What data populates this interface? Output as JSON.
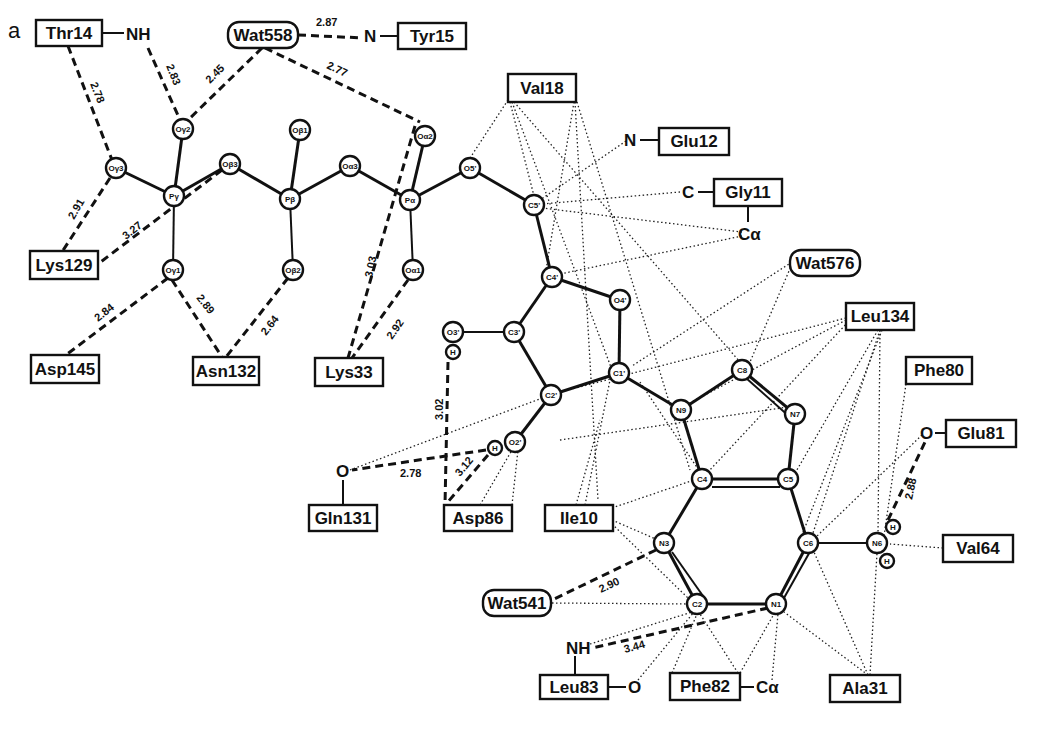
{
  "figure": {
    "panel_label": "a"
  },
  "residues": [
    {
      "id": "Thr14",
      "label": "Thr14",
      "x": 36,
      "y": 20,
      "w": 66,
      "h": 26,
      "shape": "box"
    },
    {
      "id": "Wat558",
      "label": "Wat558",
      "x": 228,
      "y": 22,
      "w": 70,
      "h": 26,
      "shape": "round"
    },
    {
      "id": "Tyr15",
      "label": "Tyr15",
      "x": 398,
      "y": 23,
      "w": 68,
      "h": 26,
      "shape": "box"
    },
    {
      "id": "Val18",
      "label": "Val18",
      "x": 508,
      "y": 74,
      "w": 68,
      "h": 28,
      "shape": "box"
    },
    {
      "id": "Glu12",
      "label": "Glu12",
      "x": 659,
      "y": 128,
      "w": 70,
      "h": 27,
      "shape": "box"
    },
    {
      "id": "Gly11",
      "label": "Gly11",
      "x": 714,
      "y": 179,
      "w": 68,
      "h": 27,
      "shape": "box"
    },
    {
      "id": "Wat576",
      "label": "Wat576",
      "x": 790,
      "y": 250,
      "w": 70,
      "h": 26,
      "shape": "round"
    },
    {
      "id": "Lys129",
      "label": "Lys129",
      "x": 30,
      "y": 251,
      "w": 68,
      "h": 28,
      "shape": "box"
    },
    {
      "id": "Leu134",
      "label": "Leu134",
      "x": 846,
      "y": 303,
      "w": 68,
      "h": 27,
      "shape": "box"
    },
    {
      "id": "Phe80",
      "label": "Phe80",
      "x": 906,
      "y": 357,
      "w": 66,
      "h": 27,
      "shape": "box"
    },
    {
      "id": "Asp145",
      "label": "Asp145",
      "x": 31,
      "y": 355,
      "w": 68,
      "h": 28,
      "shape": "box"
    },
    {
      "id": "Asn132",
      "label": "Asn132",
      "x": 193,
      "y": 357,
      "w": 66,
      "h": 28,
      "shape": "box"
    },
    {
      "id": "Lys33",
      "label": "Lys33",
      "x": 315,
      "y": 358,
      "w": 68,
      "h": 28,
      "shape": "box"
    },
    {
      "id": "Glu81",
      "label": "Glu81",
      "x": 946,
      "y": 420,
      "w": 70,
      "h": 27,
      "shape": "box"
    },
    {
      "id": "Gln131",
      "label": "Gln131",
      "x": 309,
      "y": 505,
      "w": 68,
      "h": 26,
      "shape": "box"
    },
    {
      "id": "Asp86",
      "label": "Asp86",
      "x": 444,
      "y": 505,
      "w": 68,
      "h": 26,
      "shape": "box"
    },
    {
      "id": "Ile10",
      "label": "Ile10",
      "x": 545,
      "y": 505,
      "w": 68,
      "h": 26,
      "shape": "box"
    },
    {
      "id": "Val64",
      "label": "Val64",
      "x": 943,
      "y": 535,
      "w": 70,
      "h": 27,
      "shape": "box"
    },
    {
      "id": "Wat541",
      "label": "Wat541",
      "x": 483,
      "y": 590,
      "w": 68,
      "h": 26,
      "shape": "round"
    },
    {
      "id": "Leu83",
      "label": "Leu83",
      "x": 540,
      "y": 675,
      "w": 68,
      "h": 24,
      "shape": "box"
    },
    {
      "id": "Phe82",
      "label": "Phe82",
      "x": 670,
      "y": 673,
      "w": 70,
      "h": 27,
      "shape": "box"
    },
    {
      "id": "Ala31",
      "label": "Ala31",
      "x": 830,
      "y": 675,
      "w": 70,
      "h": 27,
      "shape": "box"
    }
  ],
  "fragments": [
    {
      "id": "Thr14_NH",
      "label": "NH",
      "x": 136,
      "y": 38
    },
    {
      "id": "Tyr15_N",
      "label": "N",
      "x": 371,
      "y": 40
    },
    {
      "id": "Glu12_N",
      "label": "N",
      "x": 630,
      "y": 141
    },
    {
      "id": "Gly11_C",
      "label": "C",
      "x": 687,
      "y": 192
    },
    {
      "id": "Gly11_Ca",
      "label": "Cα",
      "x": 748,
      "y": 234
    },
    {
      "id": "Gln131_O",
      "label": "O",
      "x": 343,
      "y": 472
    },
    {
      "id": "Glu81_O",
      "label": "O",
      "x": 927,
      "y": 433
    },
    {
      "id": "Leu83_NH",
      "label": "NH",
      "x": 582,
      "y": 648
    },
    {
      "id": "Leu83_O",
      "label": "O",
      "x": 635,
      "y": 687
    },
    {
      "id": "Phe82_Ca",
      "label": "Cα",
      "x": 766,
      "y": 687
    }
  ],
  "atoms": [
    {
      "id": "Og3",
      "label": "Oγ3",
      "x": 116,
      "y": 168
    },
    {
      "id": "Og2",
      "label": "Oγ2",
      "x": 183,
      "y": 129
    },
    {
      "id": "Pg",
      "label": "Pγ",
      "x": 174,
      "y": 196
    },
    {
      "id": "Og1",
      "label": "Oγ1",
      "x": 173,
      "y": 270
    },
    {
      "id": "Ob3",
      "label": "Oβ3",
      "x": 230,
      "y": 164
    },
    {
      "id": "Ob1",
      "label": "Oβ1",
      "x": 300,
      "y": 130
    },
    {
      "id": "Pb",
      "label": "Pβ",
      "x": 290,
      "y": 199
    },
    {
      "id": "Ob2",
      "label": "Oβ2",
      "x": 293,
      "y": 270
    },
    {
      "id": "Oa3",
      "label": "Oα3",
      "x": 350,
      "y": 166
    },
    {
      "id": "Oa2",
      "label": "Oα2",
      "x": 425,
      "y": 136
    },
    {
      "id": "Pa",
      "label": "Pα",
      "x": 410,
      "y": 200
    },
    {
      "id": "Oa1",
      "label": "Oα1",
      "x": 413,
      "y": 270
    },
    {
      "id": "O5p",
      "label": "O5'",
      "x": 470,
      "y": 168
    },
    {
      "id": "C5p",
      "label": "C5'",
      "x": 534,
      "y": 205
    },
    {
      "id": "C4p",
      "label": "C4'",
      "x": 552,
      "y": 277
    },
    {
      "id": "O4p",
      "label": "O4'",
      "x": 620,
      "y": 300
    },
    {
      "id": "C3p",
      "label": "C3'",
      "x": 514,
      "y": 332
    },
    {
      "id": "O3p",
      "label": "O3'",
      "x": 453,
      "y": 332
    },
    {
      "id": "H3p",
      "label": "H",
      "x": 453,
      "y": 352
    },
    {
      "id": "C2p",
      "label": "C2'",
      "x": 551,
      "y": 395
    },
    {
      "id": "C1p",
      "label": "C1'",
      "x": 619,
      "y": 373
    },
    {
      "id": "O2p",
      "label": "O2'",
      "x": 515,
      "y": 442
    },
    {
      "id": "H2p",
      "label": "H",
      "x": 495,
      "y": 448
    },
    {
      "id": "N9",
      "label": "N9",
      "x": 681,
      "y": 410
    },
    {
      "id": "C8",
      "label": "C8",
      "x": 742,
      "y": 370
    },
    {
      "id": "N7",
      "label": "N7",
      "x": 795,
      "y": 414
    },
    {
      "id": "C4",
      "label": "C4",
      "x": 702,
      "y": 479
    },
    {
      "id": "C5",
      "label": "C5",
      "x": 788,
      "y": 479
    },
    {
      "id": "C6",
      "label": "C6",
      "x": 808,
      "y": 543
    },
    {
      "id": "N6",
      "label": "N6",
      "x": 877,
      "y": 543
    },
    {
      "id": "H6a",
      "label": "H",
      "x": 893,
      "y": 527
    },
    {
      "id": "H6b",
      "label": "H",
      "x": 887,
      "y": 561
    },
    {
      "id": "N3",
      "label": "N3",
      "x": 664,
      "y": 543
    },
    {
      "id": "C2",
      "label": "C2",
      "x": 697,
      "y": 604
    },
    {
      "id": "N1",
      "label": "N1",
      "x": 776,
      "y": 604
    }
  ],
  "hydrogen_bonds": [
    {
      "from": "Thr14",
      "to": "Og3",
      "distance": "2.78"
    },
    {
      "from": "Thr14_NH",
      "to": "Og2",
      "distance": "2.83"
    },
    {
      "from": "Wat558",
      "to": "Og2",
      "distance": "2.45"
    },
    {
      "from": "Wat558",
      "to": "Tyr15_N",
      "distance": "2.87"
    },
    {
      "from": "Wat558",
      "to": "Oa2",
      "distance": "2.77"
    },
    {
      "from": "Og3",
      "to": "Lys129",
      "distance": "2.91"
    },
    {
      "from": "Ob3",
      "to": "Lys129",
      "distance": "3.27"
    },
    {
      "from": "Og1",
      "to": "Asp145",
      "distance": "2.84"
    },
    {
      "from": "Og1",
      "to": "Asn132",
      "distance": "2.89"
    },
    {
      "from": "Ob2",
      "to": "Asn132",
      "distance": "2.64"
    },
    {
      "from": "Oa2",
      "to": "Lys33",
      "distance": "3.03"
    },
    {
      "from": "Oa1",
      "to": "Lys33",
      "distance": "2.92"
    },
    {
      "from": "H3p",
      "to": "Asp86",
      "distance": "3.02"
    },
    {
      "from": "H2p",
      "to": "Gln131_O",
      "distance": "2.78"
    },
    {
      "from": "H2p",
      "to": "Asp86",
      "distance": "3.12"
    },
    {
      "from": "N6",
      "to": "Glu81_O",
      "distance": "2.88"
    },
    {
      "from": "N3",
      "to": "Wat541",
      "distance": "2.90"
    },
    {
      "from": "N1",
      "to": "Leu83_NH",
      "distance": "3.44"
    }
  ],
  "legend": {
    "solid_line": "covalent bond",
    "dashed_line": "hydrogen bond (Å)",
    "dotted_line": "van der Waals contact"
  }
}
